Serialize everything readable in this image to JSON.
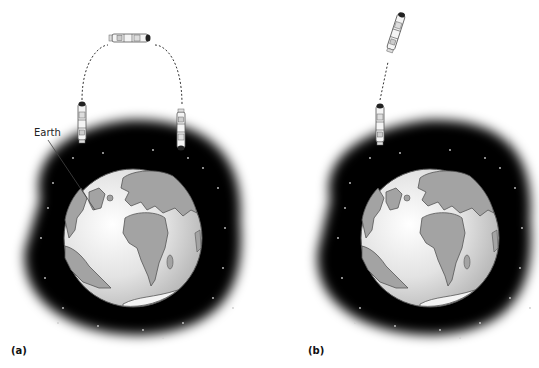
{
  "figure": {
    "panels": [
      {
        "id": "a",
        "label": "(a)",
        "earth_label": "Earth",
        "description": "Spacecraft launched upward, travels along a curved dashed arc over the top, and returns downward toward Earth"
      },
      {
        "id": "b",
        "label": "(b)",
        "description": "Spacecraft launched upward and continues along a straight dashed path away from Earth"
      }
    ],
    "colors": {
      "space": "#000000",
      "land": "#a3a3a3",
      "ocean": "#e6e6e6",
      "outline": "#555555",
      "trajectory": "#333333"
    }
  }
}
